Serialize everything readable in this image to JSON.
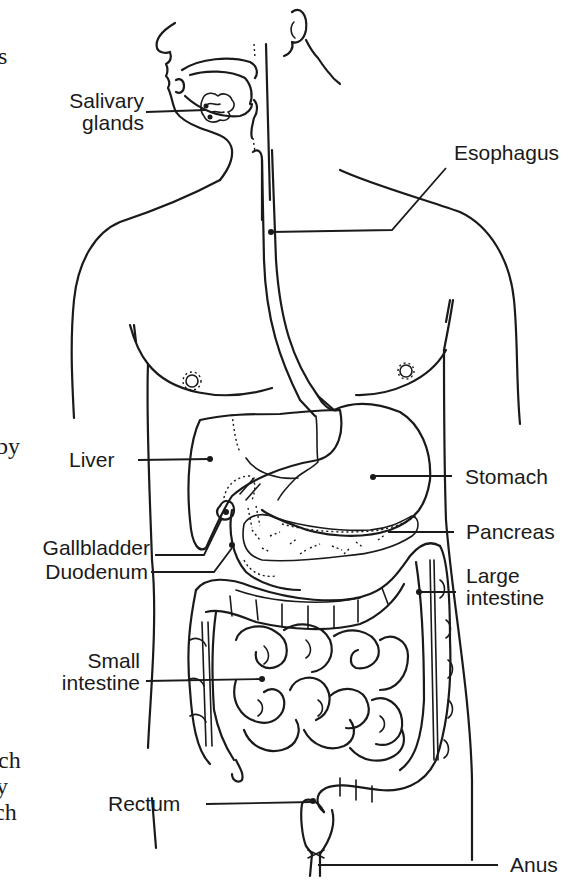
{
  "diagram": {
    "labels": {
      "salivary_glands": [
        "Salivary",
        "glands"
      ],
      "esophagus": "Esophagus",
      "liver": "Liver",
      "stomach": "Stomach",
      "gallbladder": "Gallbladder",
      "pancreas": "Pancreas",
      "duodenum": "Duodenum",
      "large_intestine": [
        "Large",
        "intestine"
      ],
      "small_intestine": [
        "Small",
        "intestine"
      ],
      "rectum": "Rectum",
      "anus": "Anus"
    },
    "cropped_text_fragments": [
      "s",
      "by",
      "ch",
      "y",
      "ch"
    ],
    "colors": {
      "ink": "#1a1a1a",
      "background": "#ffffff"
    }
  }
}
